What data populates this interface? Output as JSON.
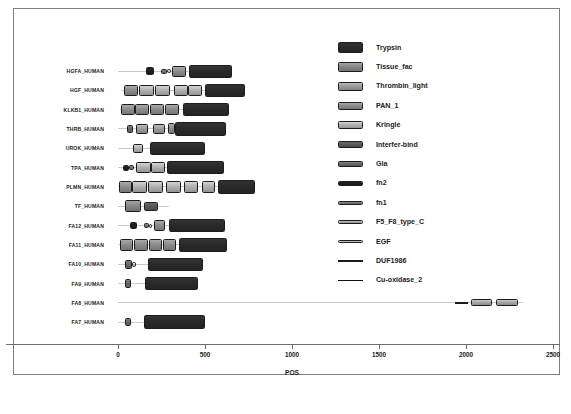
{
  "chart_data": {
    "type": "bar",
    "title": "",
    "xlabel": "POS",
    "ylabel": "",
    "xlim": [
      -40,
      2560
    ],
    "xticks": [
      0,
      500,
      1000,
      1500,
      2000,
      2500
    ],
    "xticklabels": [
      "0",
      "500",
      "1000",
      "1500",
      "2000",
      "2500"
    ],
    "grid": false,
    "legend_position": "center-right",
    "categories": [
      "HGFA_HUMAN",
      "HGF_HUMAN",
      "KLKB1_HUMAN",
      "THRB_HUMAN",
      "UROK_HUMAN",
      "TPA_HUMAN",
      "PLMN_HUMAN",
      "TF_HUMAN",
      "FA12_HUMAN",
      "FA11_HUMAN",
      "FA10_HUMAN",
      "FA9_HUMAN",
      "FA8_HUMAN",
      "FA7_HUMAN"
    ],
    "colors": {
      "Trypsin": "#2b2b2b",
      "Tissue_fac": "#8a8a8a",
      "Thrombin_light": "#9e9e9e",
      "PAN_1": "#8f8f8f",
      "Kringle": "#b4b4b4",
      "Interfer-bind": "#5a5a5a",
      "Gla": "#6b6b6b",
      "fn2": "#1f1f1f",
      "fn1": "#767676",
      "F5_F8_type_C": "#aaaaaa",
      "EGF": "#c2c2c2",
      "DUF1986": "#1a1a1a",
      "Cu-oxidase_2": "#111111"
    },
    "legend": [
      {
        "label": "Trypsin",
        "color": "#2b2b2b",
        "h": 11.5
      },
      {
        "label": "Tissue_fac",
        "color": "#8a8a8a",
        "h": 10.5
      },
      {
        "label": "Thrombin_light",
        "color": "#9e9e9e",
        "h": 9.5
      },
      {
        "label": "PAN_1",
        "color": "#8f8f8f",
        "h": 8.5
      },
      {
        "label": "Kringle",
        "color": "#b4b4b4",
        "h": 7.6
      },
      {
        "label": "Interfer-bind",
        "color": "#5a5a5a",
        "h": 6.8
      },
      {
        "label": "Gla",
        "color": "#6b6b6b",
        "h": 6.0
      },
      {
        "label": "fn2",
        "color": "#1f1f1f",
        "h": 5.2
      },
      {
        "label": "fn1",
        "color": "#767676",
        "h": 4.4
      },
      {
        "label": "F5_F8_type_C",
        "color": "#aaaaaa",
        "h": 3.8
      },
      {
        "label": "EGF",
        "color": "#c2c2c2",
        "h": 3.2
      },
      {
        "label": "DUF1986",
        "color": "#1a1a1a",
        "h": 1.8
      },
      {
        "label": "Cu-oxidase_2",
        "color": "#111111",
        "h": 1.2
      }
    ],
    "tracks": [
      {
        "name": "HGFA_HUMAN",
        "length": 655,
        "line_start": 0,
        "line_end": 655,
        "domains": [
          {
            "label": "fn2",
            "start": 163,
            "end": 205,
            "h": 7.5
          },
          {
            "label": "fn1",
            "start": 249,
            "end": 280,
            "h": 5.0
          },
          {
            "label": "EGF",
            "start": 281,
            "end": 305,
            "h": 4.0
          },
          {
            "label": "PAN_1",
            "start": 312,
            "end": 390,
            "h": 11.0
          },
          {
            "label": "Trypsin",
            "start": 410,
            "end": 655,
            "h": 13.0
          }
        ]
      },
      {
        "name": "HGF_HUMAN",
        "length": 728,
        "line_start": 20,
        "line_end": 728,
        "domains": [
          {
            "label": "PAN_1",
            "start": 36,
            "end": 116,
            "h": 11.5
          },
          {
            "label": "Kringle",
            "start": 118,
            "end": 208,
            "h": 11.0
          },
          {
            "label": "Kringle",
            "start": 212,
            "end": 300,
            "h": 11.0
          },
          {
            "label": "Kringle",
            "start": 320,
            "end": 400,
            "h": 11.0
          },
          {
            "label": "Kringle",
            "start": 404,
            "end": 482,
            "h": 11.0
          },
          {
            "label": "Trypsin",
            "start": 500,
            "end": 728,
            "h": 13.0
          }
        ]
      },
      {
        "name": "KLKB1_HUMAN",
        "length": 638,
        "line_start": 12,
        "line_end": 638,
        "domains": [
          {
            "label": "PAN_1",
            "start": 20,
            "end": 98,
            "h": 11.5
          },
          {
            "label": "PAN_1",
            "start": 100,
            "end": 180,
            "h": 11.5
          },
          {
            "label": "PAN_1",
            "start": 185,
            "end": 265,
            "h": 11.5
          },
          {
            "label": "PAN_1",
            "start": 268,
            "end": 348,
            "h": 11.5
          },
          {
            "label": "Trypsin",
            "start": 372,
            "end": 638,
            "h": 13.5
          }
        ]
      },
      {
        "name": "THRB_HUMAN",
        "length": 622,
        "line_start": 0,
        "line_end": 622,
        "domains": [
          {
            "label": "Gla",
            "start": 52,
            "end": 86,
            "h": 8.5
          },
          {
            "label": "Thrombin_light",
            "start": 102,
            "end": 170,
            "h": 10.0
          },
          {
            "label": "Thrombin_light",
            "start": 200,
            "end": 268,
            "h": 10.0
          },
          {
            "label": "PAN_1",
            "start": 285,
            "end": 330,
            "h": 11.0
          },
          {
            "label": "Trypsin",
            "start": 330,
            "end": 622,
            "h": 13.5
          }
        ]
      },
      {
        "name": "UROK_HUMAN",
        "length": 500,
        "line_start": 0,
        "line_end": 500,
        "domains": [
          {
            "label": "Kringle",
            "start": 88,
            "end": 145,
            "h": 9.5
          },
          {
            "label": "Trypsin",
            "start": 185,
            "end": 500,
            "h": 13.0
          }
        ]
      },
      {
        "name": "TPA_HUMAN",
        "length": 610,
        "line_start": 0,
        "line_end": 610,
        "domains": [
          {
            "label": "fn2",
            "start": 30,
            "end": 62,
            "h": 6.0
          },
          {
            "label": "fn1",
            "start": 63,
            "end": 92,
            "h": 4.5
          },
          {
            "label": "Kringle",
            "start": 105,
            "end": 188,
            "h": 10.5
          },
          {
            "label": "Kringle",
            "start": 192,
            "end": 270,
            "h": 10.5
          },
          {
            "label": "Trypsin",
            "start": 280,
            "end": 610,
            "h": 13.5
          }
        ]
      },
      {
        "name": "PLMN_HUMAN",
        "length": 790,
        "line_start": 0,
        "line_end": 790,
        "domains": [
          {
            "label": "PAN_1",
            "start": 8,
            "end": 78,
            "h": 12.0
          },
          {
            "label": "Kringle",
            "start": 82,
            "end": 168,
            "h": 11.5
          },
          {
            "label": "Kringle",
            "start": 172,
            "end": 258,
            "h": 11.5
          },
          {
            "label": "Kringle",
            "start": 278,
            "end": 360,
            "h": 11.5
          },
          {
            "label": "Kringle",
            "start": 382,
            "end": 462,
            "h": 11.5
          },
          {
            "label": "Kringle",
            "start": 480,
            "end": 556,
            "h": 11.5
          },
          {
            "label": "Trypsin",
            "start": 572,
            "end": 790,
            "h": 13.5
          }
        ]
      },
      {
        "name": "TF_HUMAN",
        "length": 295,
        "line_start": 0,
        "line_end": 295,
        "domains": [
          {
            "label": "Tissue_fac",
            "start": 38,
            "end": 130,
            "h": 12.0
          },
          {
            "label": "Interfer-bind",
            "start": 148,
            "end": 232,
            "h": 9.0
          }
        ]
      },
      {
        "name": "FA12_HUMAN",
        "length": 615,
        "line_start": 0,
        "line_end": 615,
        "domains": [
          {
            "label": "fn2",
            "start": 68,
            "end": 110,
            "h": 7.5
          },
          {
            "label": "fn1",
            "start": 148,
            "end": 176,
            "h": 5.0
          },
          {
            "label": "EGF",
            "start": 177,
            "end": 198,
            "h": 4.0
          },
          {
            "label": "PAN_1",
            "start": 206,
            "end": 272,
            "h": 10.5
          },
          {
            "label": "Trypsin",
            "start": 295,
            "end": 615,
            "h": 13.5
          }
        ]
      },
      {
        "name": "FA11_HUMAN",
        "length": 625,
        "line_start": 0,
        "line_end": 625,
        "domains": [
          {
            "label": "PAN_1",
            "start": 10,
            "end": 88,
            "h": 11.5
          },
          {
            "label": "PAN_1",
            "start": 92,
            "end": 172,
            "h": 11.5
          },
          {
            "label": "PAN_1",
            "start": 176,
            "end": 252,
            "h": 11.5
          },
          {
            "label": "PAN_1",
            "start": 256,
            "end": 332,
            "h": 11.5
          },
          {
            "label": "Trypsin",
            "start": 352,
            "end": 625,
            "h": 13.5
          }
        ]
      },
      {
        "name": "FA10_HUMAN",
        "length": 488,
        "line_start": 0,
        "line_end": 488,
        "domains": [
          {
            "label": "Gla",
            "start": 38,
            "end": 78,
            "h": 9.0
          },
          {
            "label": "EGF",
            "start": 80,
            "end": 104,
            "h": 5.0
          },
          {
            "label": "Trypsin",
            "start": 172,
            "end": 488,
            "h": 13.0
          }
        ]
      },
      {
        "name": "FA9_HUMAN",
        "length": 460,
        "line_start": 0,
        "line_end": 460,
        "domains": [
          {
            "label": "Gla",
            "start": 40,
            "end": 76,
            "h": 8.5
          },
          {
            "label": "Trypsin",
            "start": 158,
            "end": 460,
            "h": 13.0
          }
        ]
      },
      {
        "name": "FA8_HUMAN",
        "length": 2330,
        "line_start": 0,
        "line_end": 2330,
        "domains": [
          {
            "label": "DUF1986",
            "start": 1935,
            "end": 2010,
            "h": 2.2
          },
          {
            "label": "F5_F8_type_C",
            "start": 2030,
            "end": 2150,
            "h": 7.0
          },
          {
            "label": "F5_F8_type_C",
            "start": 2172,
            "end": 2300,
            "h": 7.0
          }
        ]
      },
      {
        "name": "FA7_HUMAN",
        "length": 502,
        "line_start": 0,
        "line_end": 502,
        "domains": [
          {
            "label": "Gla",
            "start": 42,
            "end": 76,
            "h": 8.0
          },
          {
            "label": "Trypsin",
            "start": 148,
            "end": 502,
            "h": 13.5
          }
        ]
      }
    ]
  }
}
